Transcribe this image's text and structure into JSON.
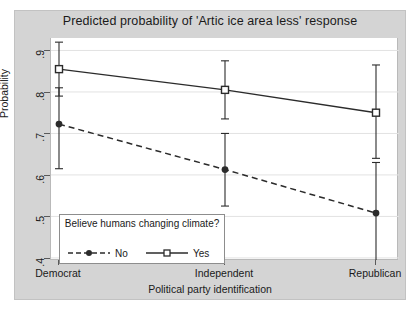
{
  "chart_data": {
    "type": "line",
    "title": "Predicted probability of 'Artic ice area less' response",
    "xlabel": "Political party identification",
    "ylabel": "Probability",
    "categories": [
      "Democrat",
      "Independent",
      "Republican"
    ],
    "x": [
      0,
      1,
      2
    ],
    "ylim": [
      0.4,
      0.93
    ],
    "yticks": [
      0.9,
      0.8,
      0.7,
      0.6,
      0.5,
      0.4
    ],
    "ytick_labels": [
      ".9",
      ".8",
      ".7",
      ".6",
      ".5",
      ".4"
    ],
    "grid": "horizontal",
    "legend_position": "inside-bottom-left",
    "legend_title": "Believe humans changing climate?",
    "series": [
      {
        "name": "Yes",
        "style": "solid",
        "marker": "open-square",
        "color": "#2b2b2b",
        "values": [
          0.855,
          0.805,
          0.75
        ],
        "ci_low": [
          0.79,
          0.735,
          0.64
        ],
        "ci_high": [
          0.92,
          0.875,
          0.865
        ]
      },
      {
        "name": "No",
        "style": "dashed",
        "marker": "filled-circle",
        "color": "#2b2b2b",
        "values": [
          0.7225,
          0.613,
          0.508
        ],
        "ci_low": [
          0.615,
          0.525,
          0.39
        ],
        "ci_high": [
          0.81,
          0.7,
          0.63
        ]
      }
    ]
  },
  "colors": {
    "graph_region": "#d4d4d4",
    "plot_background": "#ffffff",
    "axis": "#5a5a5a",
    "grid": "#e2e2e2",
    "text": "#1a1a1a"
  }
}
